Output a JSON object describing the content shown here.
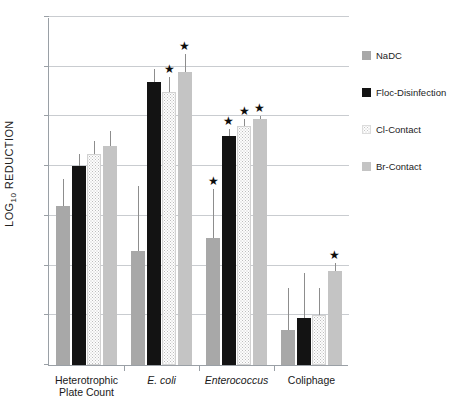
{
  "chart_data": {
    "type": "bar",
    "title": "",
    "xlabel": "",
    "ylabel": "LOG10 REDUCTION",
    "ylabel_main": "LOG",
    "ylabel_sub": "10",
    "ylabel_tail": " REDUCTION",
    "ylim": [
      0,
      7
    ],
    "ytick_labels": [
      "0",
      "1",
      "2",
      "3",
      "4",
      "5",
      "6",
      "7"
    ],
    "ytick_values": [
      0,
      1,
      2,
      3,
      4,
      5,
      6,
      7
    ],
    "grid": true,
    "legend_position": "right",
    "categories": [
      "Heterotrophic Plate Count",
      "E. coli",
      "Enterococcus",
      "Coliphage"
    ],
    "category_labels": [
      {
        "line1": "Heterotrophic",
        "line2": "Plate Count",
        "italic": false
      },
      {
        "line1": "E. coli",
        "line2": "",
        "italic": true
      },
      {
        "line1": "Enterococcus",
        "line2": "",
        "italic": true
      },
      {
        "line1": "Coliphage",
        "line2": "",
        "italic": false
      }
    ],
    "series": [
      {
        "name": "NaDC",
        "key": "nadc",
        "color": "#a8a8a8",
        "values": [
          3.2,
          2.3,
          2.55,
          0.7
        ],
        "errors_upper": [
          3.75,
          3.6,
          3.55,
          1.55
        ],
        "significant": [
          false,
          false,
          true,
          false
        ]
      },
      {
        "name": "Floc-Disinfection",
        "key": "floc",
        "color": "#131313",
        "values": [
          4.0,
          5.7,
          4.6,
          0.95
        ],
        "errors_upper": [
          4.25,
          5.95,
          4.75,
          1.85
        ],
        "significant": [
          false,
          false,
          true,
          false
        ]
      },
      {
        "name": "Cl-Contact",
        "key": "cl",
        "color": "#fdfdfd",
        "values": [
          4.25,
          5.5,
          4.8,
          1.0
        ],
        "errors_upper": [
          4.5,
          5.8,
          4.95,
          1.55
        ],
        "significant": [
          false,
          true,
          true,
          false
        ]
      },
      {
        "name": "Br-Contact",
        "key": "br",
        "color": "#c4c4c4",
        "values": [
          4.4,
          5.9,
          4.95,
          1.9
        ],
        "errors_upper": [
          4.7,
          6.25,
          5.0,
          2.05
        ],
        "significant": [
          false,
          true,
          true,
          true
        ]
      }
    ],
    "star_glyph": "★"
  },
  "legend": {
    "items": [
      {
        "label": "NaDC",
        "key": "nadc"
      },
      {
        "label": "Floc-Disinfection",
        "key": "floc"
      },
      {
        "label": "Cl-Contact",
        "key": "cl"
      },
      {
        "label": "Br-Contact",
        "key": "br"
      }
    ]
  }
}
